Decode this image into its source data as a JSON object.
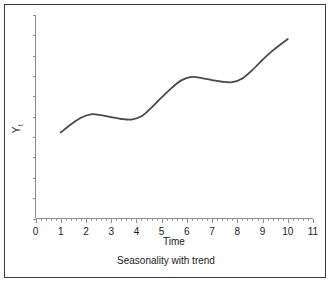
{
  "chart_data": {
    "type": "line",
    "title": "",
    "caption": "Seasonality with trend",
    "xlabel": "Time",
    "ylabel": "Y",
    "ylabel_subscript": "t",
    "xlim": [
      0,
      11
    ],
    "ylim": [
      0,
      10
    ],
    "grid": false,
    "legend": null,
    "x_ticks": [
      "0",
      "1",
      "2",
      "3",
      "4",
      "5",
      "6",
      "7",
      "8",
      "9",
      "10",
      "11"
    ],
    "x_tick_values": [
      0,
      1,
      2,
      3,
      4,
      5,
      6,
      7,
      8,
      9,
      10,
      11
    ],
    "x_minor_ticks_per_interval": 4,
    "y_ticks_labeled": false,
    "y_tick_count": 10,
    "series": [
      {
        "name": "Yt",
        "color": "#4a4a4a",
        "x": [
          1.0,
          1.4,
          1.8,
          2.2,
          2.6,
          3.0,
          3.4,
          3.8,
          4.2,
          4.6,
          5.0,
          5.4,
          5.8,
          6.2,
          6.6,
          7.0,
          7.4,
          7.8,
          8.2,
          8.6,
          9.0,
          9.4,
          10.0
        ],
        "y": [
          4.23,
          4.62,
          4.95,
          5.12,
          5.08,
          4.98,
          4.89,
          4.86,
          5.02,
          5.45,
          5.95,
          6.42,
          6.8,
          6.96,
          6.9,
          6.8,
          6.72,
          6.7,
          6.88,
          7.3,
          7.8,
          8.25,
          8.82
        ]
      }
    ]
  },
  "axis_labels": {
    "x_title": "Time",
    "y_title": "Y",
    "y_subscript": "t"
  },
  "caption": {
    "text": "Seasonality with trend"
  },
  "colors": {
    "curve": "#4a4a4a",
    "axis": "#8c8c8c",
    "border": "#3a3a3a",
    "background": "#ffffff",
    "text": "#1a1a1a"
  }
}
